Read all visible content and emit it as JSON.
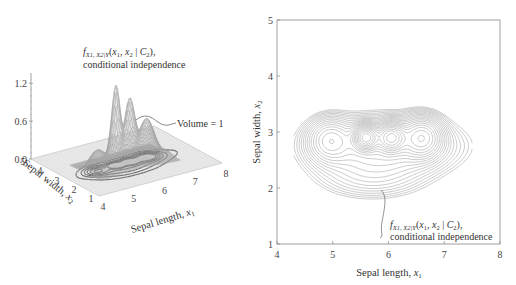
{
  "chart_data": [
    {
      "type": "surface3d",
      "title": "",
      "annotation_top": "f_{X1,X2|Y}(x1, x2 | C2),",
      "annotation_top_line2": "conditional independence",
      "annotation_volume": "Volume = 1",
      "xlabel": "Sepal length, x1",
      "ylabel": "Sepal width, x2",
      "zlabel": "",
      "xlim": [
        4,
        8
      ],
      "ylim": [
        1,
        5
      ],
      "zlim": [
        0,
        1.2
      ],
      "x_ticks": [
        "4",
        "5",
        "6",
        "7",
        "8"
      ],
      "y_ticks": [
        "1",
        "2",
        "3",
        "4",
        "5"
      ],
      "z_ticks": [
        "0.0",
        "0.6",
        "1.2"
      ],
      "peaks": [
        {
          "x": 5.6,
          "y": 2.9,
          "z": 1.0
        },
        {
          "x": 6.1,
          "y": 2.9,
          "z": 0.8
        },
        {
          "x": 6.6,
          "y": 2.9,
          "z": 0.5
        },
        {
          "x": 5.0,
          "y": 2.4,
          "z": 0.25
        }
      ]
    },
    {
      "type": "contour",
      "annotation": "f_{X1,X2|Y}(x1, x2 | C2),",
      "annotation_line2": "conditional independence",
      "xlabel": "Sepal length, x1",
      "ylabel": "Sepal width, x2",
      "xlim": [
        4,
        8
      ],
      "ylim": [
        1,
        5
      ],
      "x_ticks": [
        "4",
        "5",
        "6",
        "7",
        "8"
      ],
      "y_ticks": [
        "1",
        "2",
        "3",
        "4",
        "5"
      ],
      "peaks": [
        {
          "x": 5.6,
          "y": 2.9
        },
        {
          "x": 6.05,
          "y": 2.9
        },
        {
          "x": 4.95,
          "y": 2.85
        }
      ]
    }
  ],
  "colors": {
    "axis": "#888888",
    "contour": "#9a9a9a",
    "mesh": "#b5b5b5",
    "surface_dark": "#555555"
  }
}
